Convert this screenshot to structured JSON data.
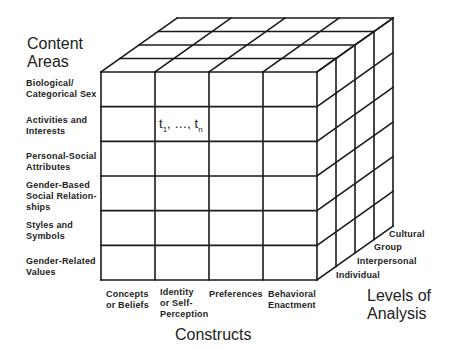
{
  "axes": {
    "content_areas": {
      "title_line1": "Content",
      "title_line2": "Areas",
      "items": [
        {
          "line1": "Biological/",
          "line2": "Categorical Sex",
          "line3": ""
        },
        {
          "line1": "Activities and",
          "line2": "Interests",
          "line3": ""
        },
        {
          "line1": "Personal-Social",
          "line2": "Attributes",
          "line3": ""
        },
        {
          "line1": "Gender-Based",
          "line2": "Social Relation-",
          "line3": "ships"
        },
        {
          "line1": "Styles and",
          "line2": "Symbols",
          "line3": ""
        },
        {
          "line1": "Gender-Related",
          "line2": "Values",
          "line3": ""
        }
      ]
    },
    "constructs": {
      "title": "Constructs",
      "items": [
        {
          "line1": "Concepts",
          "line2": "or Beliefs",
          "line3": ""
        },
        {
          "line1": "Identity",
          "line2": "or Self-",
          "line3": "Perception"
        },
        {
          "line1": "Preferences",
          "line2": "",
          "line3": ""
        },
        {
          "line1": "Behavioral",
          "line2": "Enactment",
          "line3": ""
        }
      ]
    },
    "levels_of_analysis": {
      "title_line1": "Levels of",
      "title_line2": "Analysis",
      "items": [
        "Individual",
        "Interpersonal",
        "Group",
        "Cultural"
      ]
    }
  },
  "cell_annotation": {
    "t_start": "t",
    "t_start_sub": "1",
    "ellipsis": ", …, ",
    "t_end": "t",
    "t_end_sub": "n"
  },
  "colors": {
    "line": "#1a1a1a",
    "background": "#ffffff"
  }
}
